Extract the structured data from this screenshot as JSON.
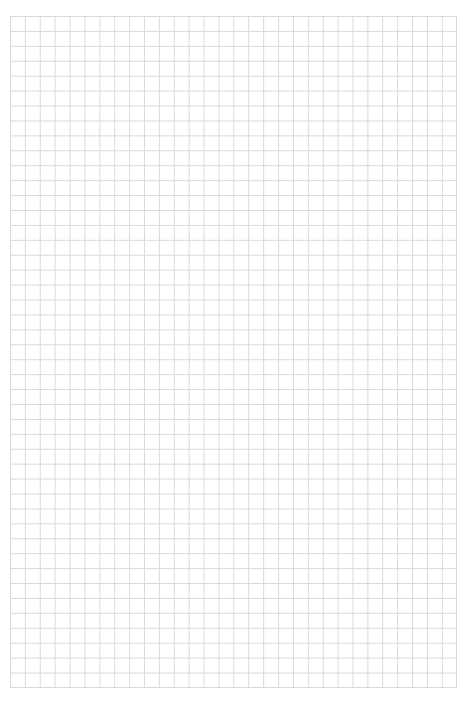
{
  "page": {
    "type": "grid-paper",
    "background_color": "#ffffff",
    "grid_line_color": "#d9d9d9",
    "grid_columns": 30,
    "grid_rows": 45
  }
}
